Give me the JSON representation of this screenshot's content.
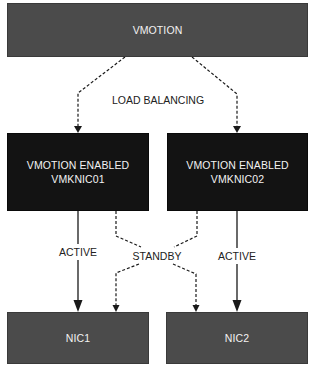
{
  "diagram": {
    "top": {
      "label": "VMOTION"
    },
    "load_balancing_label": "LOAD BALANCING",
    "vmknics": [
      {
        "line1": "VMOTION ENABLED",
        "line2": "VMKNIC01"
      },
      {
        "line1": "VMOTION ENABLED",
        "line2": "VMKNIC02"
      }
    ],
    "links": {
      "active_left": "ACTIVE",
      "standby": "STANDBY",
      "active_right": "ACTIVE"
    },
    "nics": [
      {
        "label": "NIC1"
      },
      {
        "label": "NIC2"
      }
    ],
    "colors": {
      "top_fill": "#4b4b4b",
      "vmknic_fill": "#131313",
      "nic_fill": "#4b4b4b",
      "text_on_box": "#f2f2f2",
      "line": "#1a1a1a"
    }
  }
}
